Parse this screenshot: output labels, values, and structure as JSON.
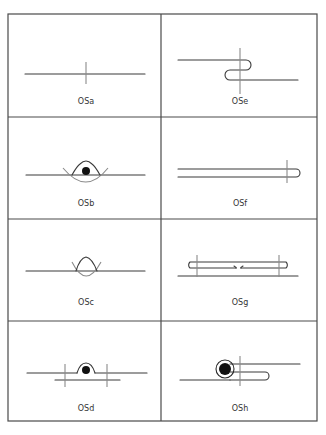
{
  "figure": {
    "grid": {
      "columns": 2,
      "rows": 4
    },
    "cells": [
      {
        "id": "OSa",
        "label": "OSa",
        "row": 0,
        "col": 0
      },
      {
        "id": "OSe",
        "label": "OSe",
        "row": 0,
        "col": 1
      },
      {
        "id": "OSb",
        "label": "OSb",
        "row": 1,
        "col": 0
      },
      {
        "id": "OSf",
        "label": "OSf",
        "row": 1,
        "col": 1
      },
      {
        "id": "OSc",
        "label": "OSc",
        "row": 2,
        "col": 0
      },
      {
        "id": "OSg",
        "label": "OSg",
        "row": 2,
        "col": 1
      },
      {
        "id": "OSd",
        "label": "OSd",
        "row": 3,
        "col": 0
      },
      {
        "id": "OSh",
        "label": "OSh",
        "row": 3,
        "col": 1
      }
    ],
    "colors": {
      "line": "#3a3a3a",
      "grid": "#4a4a4a",
      "crossbar": "#8a8a8a",
      "fill": "#111111"
    }
  }
}
